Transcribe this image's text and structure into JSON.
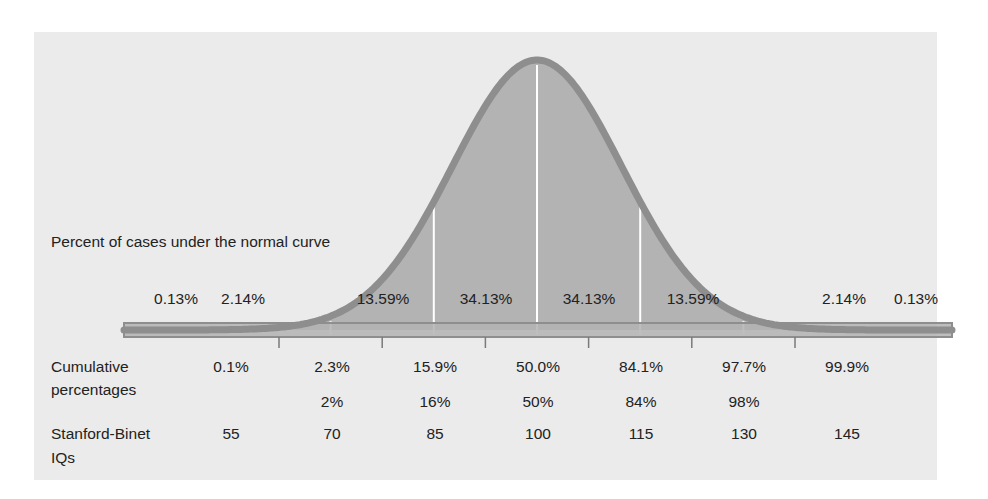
{
  "chart_data": {
    "type": "area",
    "section_label": "Percent of cases under the normal curve",
    "xlabel": "",
    "ylabel": "",
    "grid": false,
    "legend": "none",
    "segments": [
      "0.13%",
      "2.14%",
      "13.59%",
      "34.13%",
      "34.13%",
      "13.59%",
      "2.14%",
      "0.13%"
    ],
    "segment_values": [
      0.13,
      2.14,
      13.59,
      34.13,
      34.13,
      13.59,
      2.14,
      0.13
    ],
    "rows": [
      {
        "label_line1": "Cumulative",
        "label_line2": "percentages",
        "values": [
          "0.1%",
          "2.3%",
          "15.9%",
          "50.0%",
          "84.1%",
          "97.7%",
          "99.9%"
        ],
        "rounded": [
          "",
          "2%",
          "16%",
          "50%",
          "84%",
          "98%",
          ""
        ]
      },
      {
        "label_line1": "Stanford-Binet",
        "label_line2": "IQs",
        "values": [
          "55",
          "70",
          "85",
          "100",
          "115",
          "130",
          "145"
        ]
      }
    ],
    "iq_values": [
      55,
      70,
      85,
      100,
      115,
      130,
      145
    ],
    "cumulative_values": [
      0.1,
      2.3,
      15.9,
      50.0,
      84.1,
      97.7,
      99.9
    ],
    "colors": {
      "background": "#ebebeb",
      "fill": "#b3b3b3",
      "curve": "#8e8e8e",
      "divider": "#ffffff",
      "tick": "#7a7a7a"
    }
  }
}
